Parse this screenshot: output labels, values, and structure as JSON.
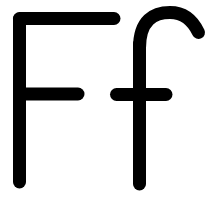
{
  "card": {
    "name": "letter-card-ff",
    "letter_pair": "Ff",
    "letter_name": "F",
    "uppercase": "F",
    "lowercase": "f",
    "background_color": "#ffffff",
    "ink_color": "#000000"
  },
  "glyph_art": {
    "type": "letterform",
    "canvas_width": 211,
    "canvas_height": 199,
    "stroke_color": "#000000",
    "stroke_width": 13,
    "line_cap": "round",
    "line_join": "round",
    "strokes": [
      {
        "id": "uppercase-f-stem",
        "label": "F vertical stem",
        "path": "M 19.5 19 L 19.5 182"
      },
      {
        "id": "uppercase-f-top-bar",
        "label": "F top horizontal bar",
        "path": "M 19.5 18.5 L 114 18.5"
      },
      {
        "id": "uppercase-f-crossbar",
        "label": "F middle crossbar",
        "path": "M 19.5 94 L 78 94"
      },
      {
        "id": "lowercase-f-stem",
        "label": "f vertical stem",
        "path": "M 139.5 44 L 139.5 184"
      },
      {
        "id": "lowercase-f-hook",
        "label": "f ascender hook curving right",
        "path": "M 139.5 48 C 139.5 20 154 12.5 170 12.5 C 186 12.5 194 23 198.5 32.5"
      },
      {
        "id": "lowercase-f-crossbar",
        "label": "f crossbar",
        "path": "M 116.5 94.5 L 166 94.5"
      }
    ]
  }
}
